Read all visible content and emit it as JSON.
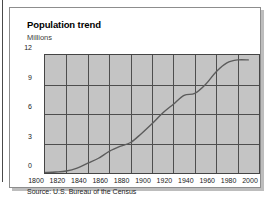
{
  "chart_data": {
    "type": "line",
    "title": "Population trend",
    "ylabel": "Millions",
    "xlabel": "",
    "source": "Source: U.S. Bureau of the Census",
    "grid": true,
    "legend": "none",
    "xlim": [
      1800,
      2000
    ],
    "ylim": [
      0,
      12
    ],
    "ytick_labels": [
      "12",
      "9",
      "6",
      "3",
      "0"
    ],
    "ytick_values": [
      12,
      9,
      6,
      3,
      0
    ],
    "xtick_labels": [
      "1800",
      "1820",
      "1840",
      "1860",
      "1880",
      "1900",
      "1920",
      "1940",
      "1960",
      "1980",
      "2000"
    ],
    "xtick_values": [
      1800,
      1820,
      1840,
      1860,
      1880,
      1900,
      1920,
      1940,
      1960,
      1980,
      2000
    ],
    "series": [
      {
        "name": "Population",
        "x": [
          1800,
          1810,
          1820,
          1830,
          1840,
          1850,
          1860,
          1870,
          1880,
          1890,
          1900,
          1910,
          1920,
          1930,
          1940,
          1950,
          1960,
          1970,
          1980,
          1990
        ],
        "values": [
          0.05,
          0.1,
          0.2,
          0.5,
          1.0,
          1.5,
          2.2,
          2.7,
          3.1,
          4.0,
          5.0,
          6.1,
          7.0,
          7.9,
          8.1,
          9.0,
          10.3,
          11.2,
          11.5,
          11.5
        ]
      }
    ]
  }
}
